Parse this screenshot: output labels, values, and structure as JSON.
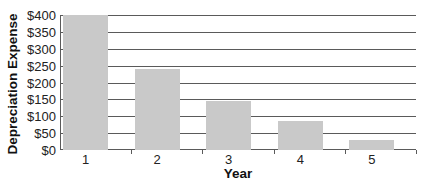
{
  "chart_data": {
    "type": "bar",
    "title": "",
    "xlabel": "Year",
    "ylabel": "Depreciation Expense",
    "categories": [
      "1",
      "2",
      "3",
      "4",
      "5"
    ],
    "values": [
      400,
      240,
      144,
      86.4,
      29.6
    ],
    "ylim": [
      0,
      400
    ],
    "yticks": [
      "$0",
      "$50",
      "$100",
      "$150",
      "$200",
      "$250",
      "$300",
      "$350",
      "$400"
    ],
    "grid": true,
    "legend": null,
    "colors": {
      "bar": "#c9c9c9",
      "grid": "#5a5a5a"
    }
  }
}
